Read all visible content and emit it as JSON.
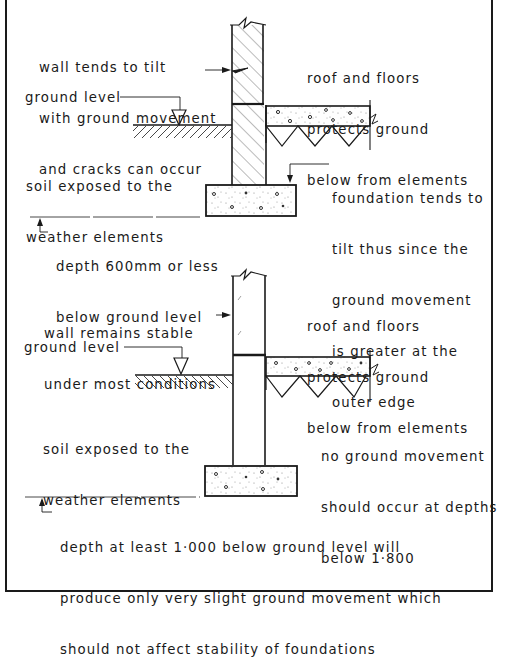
{
  "diagram": {
    "top_section": {
      "label_wall": [
        "wall tends to tilt",
        "with ground movement",
        "and cracks can occur"
      ],
      "label_ground_level": "ground level",
      "label_roof_floors": [
        "roof and floors",
        "protects ground",
        "below from elements"
      ],
      "label_soil": [
        "soil exposed to the",
        "weather elements"
      ],
      "label_foundation": [
        "foundation tends to",
        "tilt thus since the",
        "ground movement",
        "is greater at the",
        "outer edge"
      ],
      "label_depth": [
        "depth 600mm or less",
        "below ground level"
      ]
    },
    "bottom_section": {
      "label_wall": [
        "wall remains stable",
        "under most conditions"
      ],
      "label_ground_level": "ground level",
      "label_roof_floors": [
        "roof and floors",
        "protects ground",
        "below from elements"
      ],
      "label_soil": [
        "soil exposed to the",
        "weather elements"
      ],
      "label_no_movement": [
        "no ground movement",
        "should occur at depths",
        "below 1·800"
      ],
      "label_depth": [
        "depth at least 1·000 below ground level will",
        "produce only very slight ground movement which",
        "should not affect stability of foundations"
      ]
    },
    "colors": {
      "ink": "#1a1a1a",
      "background": "#ffffff",
      "concrete_speckle": "#9a9a9a"
    }
  }
}
